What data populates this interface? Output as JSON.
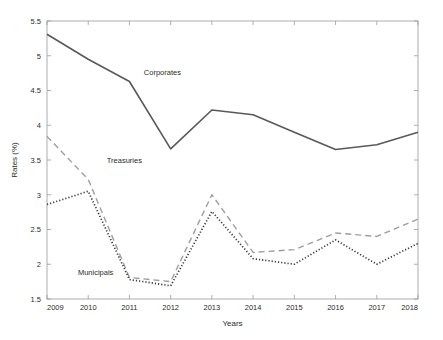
{
  "chart_data": {
    "type": "line",
    "title": "",
    "xlabel": "Years",
    "ylabel": "Rates (%)",
    "categories": [
      "2009",
      "2010",
      "2011",
      "2012",
      "2013",
      "2014",
      "2015",
      "2016",
      "2017",
      "2018"
    ],
    "x": [
      2009,
      2010,
      2011,
      2012,
      2013,
      2014,
      2015,
      2016,
      2017,
      2018
    ],
    "xlim": [
      2009,
      2018
    ],
    "ylim": [
      1.5,
      5.5
    ],
    "yticks": [
      1.5,
      2,
      2.5,
      3,
      3.5,
      4,
      4.5,
      5,
      5.5
    ],
    "ytick_labels": [
      "1.5",
      "2",
      "2.5",
      "3",
      "3.5",
      "4",
      "4.5",
      "5",
      "5.5"
    ],
    "xticks": [
      2009,
      2010,
      2011,
      2012,
      2013,
      2014,
      2015,
      2016,
      2017,
      2018
    ],
    "grid": false,
    "legend": "inline-annotations",
    "series": [
      {
        "name": "Corporates",
        "style": "solid",
        "color": "#595959",
        "values": [
          5.31,
          4.95,
          4.63,
          3.66,
          4.22,
          4.15,
          3.9,
          3.65,
          3.72,
          3.9
        ],
        "label_position": {
          "x": 2011.35,
          "y": 4.72
        }
      },
      {
        "name": "Treasuries",
        "style": "dashed",
        "color": "#9e9e9e",
        "values": [
          3.84,
          3.22,
          1.81,
          1.75,
          3.0,
          2.17,
          2.21,
          2.45,
          2.4,
          2.65
        ],
        "label_position": {
          "x": 2010.45,
          "y": 3.46
        }
      },
      {
        "name": "Municipals",
        "style": "dotted",
        "color": "#3a3a3a",
        "values": [
          2.86,
          3.05,
          1.78,
          1.69,
          2.76,
          2.08,
          2.0,
          2.35,
          2.0,
          2.3
        ],
        "label_position": {
          "x": 2009.75,
          "y": 1.85
        }
      }
    ]
  },
  "axes": {
    "frame_color": "#9a9a9a",
    "background": "#ffffff"
  }
}
